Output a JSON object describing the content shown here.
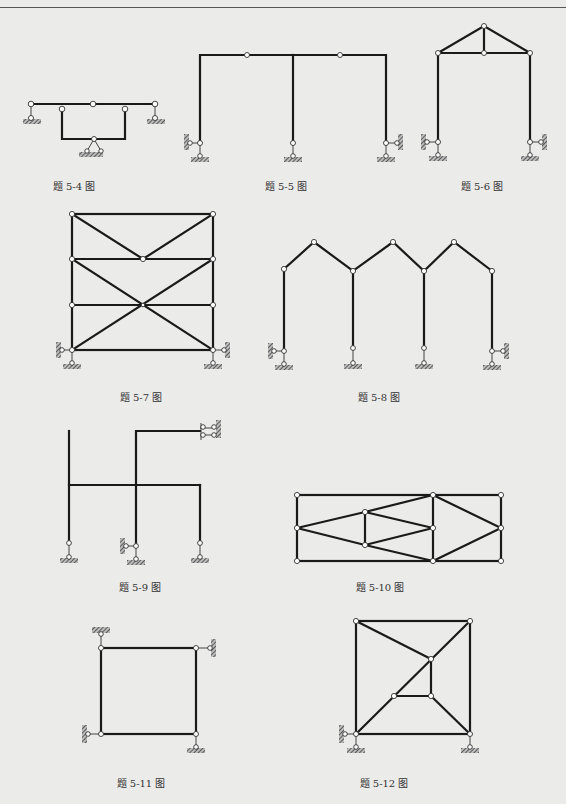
{
  "page": {
    "figures": [
      {
        "id": "5-4",
        "caption": "题 5-4 图",
        "caption_x": 74,
        "caption_y": 178
      },
      {
        "id": "5-5",
        "caption": "题 5-5 图",
        "caption_x": 286,
        "caption_y": 178
      },
      {
        "id": "5-6",
        "caption": "题 5-6 图",
        "caption_x": 482,
        "caption_y": 178
      },
      {
        "id": "5-7",
        "caption": "题 5-7 图",
        "caption_x": 141,
        "caption_y": 390
      },
      {
        "id": "5-8",
        "caption": "题 5-8 图",
        "caption_x": 379,
        "caption_y": 390
      },
      {
        "id": "5-9",
        "caption": "题 5-9 图",
        "caption_x": 140,
        "caption_y": 580
      },
      {
        "id": "5-10",
        "caption": "题 5-10 图",
        "caption_x": 380,
        "caption_y": 580
      },
      {
        "id": "5-11",
        "caption": "题 5-11 图",
        "caption_x": 141,
        "caption_y": 775
      },
      {
        "id": "5-12",
        "caption": "题 5-12 图",
        "caption_x": 384,
        "caption_y": 775
      }
    ]
  },
  "colors": {
    "background": "#ebebea",
    "line": "#1a1a1a",
    "hinge_fill": "#ffffff"
  }
}
